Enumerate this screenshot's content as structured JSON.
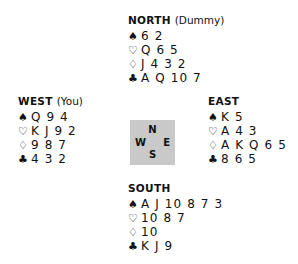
{
  "suit_symbols": {
    "spade": "♠",
    "heart": "♡",
    "diamond": "♢",
    "club": "♣"
  },
  "compass": {
    "north": "N",
    "west": "W",
    "east": "E",
    "south": "S",
    "background_color": "#c9c9c9"
  },
  "hands": {
    "north": {
      "name": "NORTH",
      "qualifier": "(Dummy)",
      "suits": [
        {
          "suit": "spade",
          "symbol": "♠",
          "cards": "6 2"
        },
        {
          "suit": "heart",
          "symbol": "♡",
          "cards": "Q 6 5"
        },
        {
          "suit": "diamond",
          "symbol": "♢",
          "cards": "J 4 3 2"
        },
        {
          "suit": "club",
          "symbol": "♣",
          "cards": "A Q 10 7"
        }
      ]
    },
    "west": {
      "name": "WEST",
      "qualifier": "(You)",
      "suits": [
        {
          "suit": "spade",
          "symbol": "♠",
          "cards": "Q 9 4"
        },
        {
          "suit": "heart",
          "symbol": "♡",
          "cards": "K J 9 2"
        },
        {
          "suit": "diamond",
          "symbol": "♢",
          "cards": "9 8 7"
        },
        {
          "suit": "club",
          "symbol": "♣",
          "cards": "4 3 2"
        }
      ]
    },
    "east": {
      "name": "EAST",
      "qualifier": "",
      "suits": [
        {
          "suit": "spade",
          "symbol": "♠",
          "cards": "K 5"
        },
        {
          "suit": "heart",
          "symbol": "♡",
          "cards": "A 4 3"
        },
        {
          "suit": "diamond",
          "symbol": "♢",
          "cards": "A K Q 6 5"
        },
        {
          "suit": "club",
          "symbol": "♣",
          "cards": "8 6 5"
        }
      ]
    },
    "south": {
      "name": "SOUTH",
      "qualifier": "",
      "suits": [
        {
          "suit": "spade",
          "symbol": "♠",
          "cards": "A J 10 8 7 3"
        },
        {
          "suit": "heart",
          "symbol": "♡",
          "cards": "10 8 7"
        },
        {
          "suit": "diamond",
          "symbol": "♢",
          "cards": "10"
        },
        {
          "suit": "club",
          "symbol": "♣",
          "cards": "K J 9"
        }
      ]
    }
  }
}
